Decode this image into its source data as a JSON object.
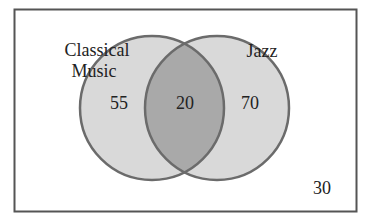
{
  "diagram": {
    "type": "venn",
    "sets": [
      {
        "label_line1": "Classical",
        "label_line2": "Music",
        "only_count": "55"
      },
      {
        "label": "Jazz",
        "only_count": "70"
      }
    ],
    "intersection_count": "20",
    "outside_count": "30",
    "colors": {
      "border": "#555555",
      "circle_fill": "#d9d9d9",
      "intersection_fill": "#a9a9a9",
      "circle_stroke": "#6b6b6b",
      "background": "#ffffff"
    }
  }
}
